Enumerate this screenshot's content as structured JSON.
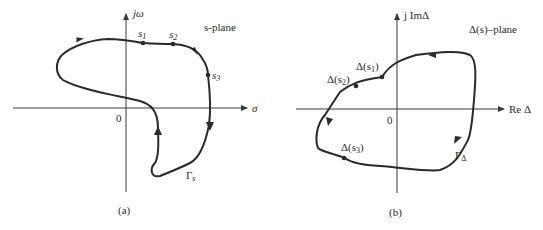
{
  "panel_a": {
    "caption": "(a)",
    "plane_label": "s-plane",
    "y_axis_label": "jω",
    "x_axis_label": "σ",
    "origin_label": "0",
    "contour_label": "Γ",
    "contour_sub": "s",
    "points": [
      {
        "name": "s",
        "sub": "1"
      },
      {
        "name": "s",
        "sub": "2"
      },
      {
        "name": "s",
        "sub": "3"
      }
    ]
  },
  "panel_b": {
    "caption": "(b)",
    "plane_label": "Δ(s)–plane",
    "y_axis_label": "j ImΔ",
    "x_axis_label": "Re Δ",
    "origin_label": "0",
    "contour_label": "Γ",
    "contour_sub": "Δ",
    "points": [
      {
        "name": "Δ(s",
        "sub": "1",
        "close": ")"
      },
      {
        "name": "Δ(s",
        "sub": "2",
        "close": ")"
      },
      {
        "name": "Δ(s",
        "sub": "3",
        "close": ")"
      }
    ]
  },
  "colors": {
    "line": "#2a2a2a",
    "axis": "#3a3a3a",
    "background": "#ffffff"
  }
}
